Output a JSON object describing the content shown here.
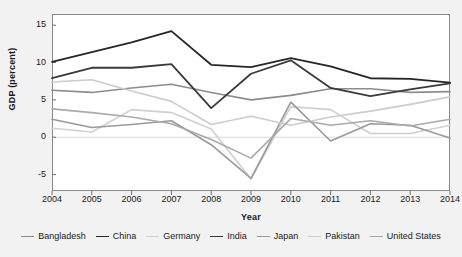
{
  "chart_data": {
    "type": "line",
    "title": "",
    "xlabel": "Year",
    "ylabel": "GDP (percent)",
    "x": [
      2004,
      2005,
      2006,
      2007,
      2008,
      2009,
      2010,
      2011,
      2012,
      2013,
      2014
    ],
    "categories": [
      "2004",
      "2005",
      "2006",
      "2007",
      "2008",
      "2009",
      "2010",
      "2011",
      "2012",
      "2013",
      "2014"
    ],
    "xlim": [
      2004,
      2014
    ],
    "ylim": [
      -7.2,
      16.5
    ],
    "yticks": [
      15,
      10,
      5,
      0,
      -5
    ],
    "ytick_labels": [
      "15",
      "10",
      "5",
      "0",
      "-5"
    ],
    "grid": false,
    "legend_position": "bottom",
    "series": [
      {
        "name": "Bangladesh",
        "color": "#8c8c8c",
        "width": 1.6,
        "values": [
          6.3,
          6.0,
          6.6,
          7.1,
          6.0,
          5.0,
          5.6,
          6.5,
          6.5,
          6.0,
          6.1
        ]
      },
      {
        "name": "China",
        "color": "#262626",
        "width": 1.8,
        "values": [
          10.1,
          11.4,
          12.7,
          14.2,
          9.7,
          9.4,
          10.6,
          9.5,
          7.9,
          7.8,
          7.3
        ]
      },
      {
        "name": "Germany",
        "color": "#d0d0d0",
        "width": 1.6,
        "values": [
          1.2,
          0.7,
          3.7,
          3.3,
          1.1,
          -5.6,
          4.1,
          3.7,
          0.5,
          0.5,
          1.6
        ]
      },
      {
        "name": "India",
        "color": "#3a3a3a",
        "width": 1.8,
        "values": [
          7.9,
          9.3,
          9.3,
          9.8,
          3.9,
          8.5,
          10.3,
          6.6,
          5.5,
          6.4,
          7.2
        ]
      },
      {
        "name": "Japan",
        "color": "#9a9a9a",
        "width": 1.6,
        "values": [
          2.4,
          1.3,
          1.7,
          2.2,
          -1.0,
          -5.5,
          4.7,
          -0.5,
          1.8,
          1.6,
          -0.1
        ]
      },
      {
        "name": "Pakistan",
        "color": "#cccccc",
        "width": 1.6,
        "values": [
          7.4,
          7.7,
          6.2,
          4.8,
          1.7,
          2.8,
          1.6,
          2.7,
          3.5,
          4.4,
          5.4
        ]
      },
      {
        "name": "United States",
        "color": "#aaaaaa",
        "width": 1.6,
        "values": [
          3.8,
          3.3,
          2.7,
          1.8,
          -0.3,
          -2.8,
          2.5,
          1.6,
          2.2,
          1.5,
          2.4
        ]
      }
    ]
  },
  "axis": {
    "ylabel": "GDP (percent)",
    "xlabel": "Year"
  }
}
